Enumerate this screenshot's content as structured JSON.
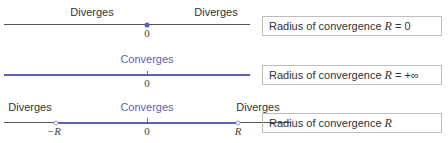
{
  "rows": [
    {
      "labels": {
        "left": "Diverges",
        "right": "Diverges"
      },
      "tick_zero": "0",
      "box": {
        "prefix": "Radius of convergence ",
        "var": "R",
        "suffix": " = 0"
      }
    },
    {
      "labels": {
        "center": "Converges"
      },
      "tick_zero": "0",
      "box": {
        "prefix": "Radius of convergence ",
        "var": "R",
        "suffix": " = +∞"
      }
    },
    {
      "labels": {
        "left": "Diverges",
        "center": "Converges",
        "right": "Diverges"
      },
      "tick_neg": "−R",
      "tick_zero": "0",
      "tick_pos": "R",
      "box": {
        "prefix": "Radius of convergence ",
        "var": "R",
        "suffix": ""
      }
    }
  ],
  "colors": {
    "converge": "#5b5fb8",
    "diverge": "#555555",
    "box_border": "#bdbdbd"
  }
}
